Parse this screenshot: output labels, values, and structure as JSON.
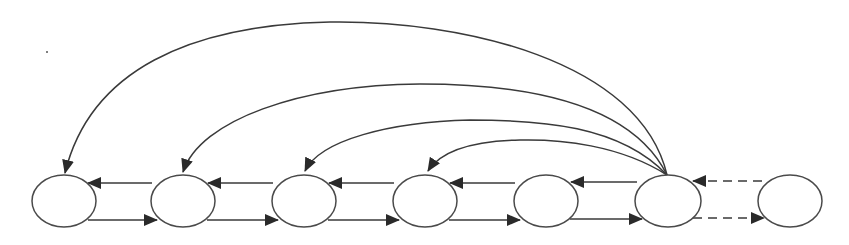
{
  "diagram": {
    "type": "node-link",
    "colors": {
      "stroke": "#3a3a3a",
      "background": "#ffffff"
    },
    "nodes": [
      {
        "id": "n1",
        "cx": 64,
        "cy": 201,
        "rx": 32,
        "ry": 26,
        "label": ""
      },
      {
        "id": "n2",
        "cx": 183,
        "cy": 201,
        "rx": 32,
        "ry": 26,
        "label": ""
      },
      {
        "id": "n3",
        "cx": 304,
        "cy": 201,
        "rx": 32,
        "ry": 26,
        "label": ""
      },
      {
        "id": "n4",
        "cx": 425,
        "cy": 201,
        "rx": 32,
        "ry": 26,
        "label": ""
      },
      {
        "id": "n5",
        "cx": 546,
        "cy": 201,
        "rx": 32,
        "ry": 26,
        "label": ""
      },
      {
        "id": "n6",
        "cx": 668,
        "cy": 201,
        "rx": 33,
        "ry": 26,
        "label": ""
      },
      {
        "id": "n7",
        "cx": 790,
        "cy": 201,
        "rx": 32,
        "ry": 26,
        "label": ""
      }
    ],
    "edges": [
      {
        "from": "n2",
        "to": "n1",
        "style": "solid",
        "kind": "backward"
      },
      {
        "from": "n1",
        "to": "n2",
        "style": "solid",
        "kind": "forward"
      },
      {
        "from": "n3",
        "to": "n2",
        "style": "solid",
        "kind": "backward"
      },
      {
        "from": "n2",
        "to": "n3",
        "style": "solid",
        "kind": "forward"
      },
      {
        "from": "n4",
        "to": "n3",
        "style": "solid",
        "kind": "backward"
      },
      {
        "from": "n3",
        "to": "n4",
        "style": "solid",
        "kind": "forward"
      },
      {
        "from": "n5",
        "to": "n4",
        "style": "solid",
        "kind": "backward"
      },
      {
        "from": "n4",
        "to": "n5",
        "style": "solid",
        "kind": "forward"
      },
      {
        "from": "n6",
        "to": "n5",
        "style": "solid",
        "kind": "backward"
      },
      {
        "from": "n5",
        "to": "n6",
        "style": "solid",
        "kind": "forward"
      },
      {
        "from": "n7",
        "to": "n6",
        "style": "dashed",
        "kind": "backward"
      },
      {
        "from": "n6",
        "to": "n7",
        "style": "dashed",
        "kind": "forward"
      },
      {
        "from": "n6",
        "to": "n1",
        "style": "solid",
        "kind": "arc"
      },
      {
        "from": "n6",
        "to": "n2",
        "style": "solid",
        "kind": "arc"
      },
      {
        "from": "n6",
        "to": "n3",
        "style": "solid",
        "kind": "arc"
      },
      {
        "from": "n6",
        "to": "n4",
        "style": "solid",
        "kind": "arc"
      }
    ]
  }
}
